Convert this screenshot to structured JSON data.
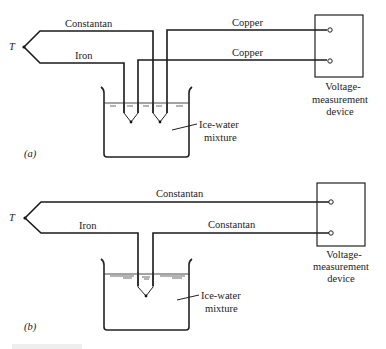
{
  "panels": [
    {
      "id": "a",
      "label": "(a)",
      "junction_label": "T",
      "wires": {
        "top_left": "Constantan",
        "bottom_left": "Iron",
        "top_right": "Copper",
        "bottom_right": "Copper"
      },
      "bath_label_line1": "Ice-water",
      "bath_label_line2": "mixture",
      "device_label_line1": "Voltage-",
      "device_label_line2": "measurement",
      "device_label_line3": "device"
    },
    {
      "id": "b",
      "label": "(b)",
      "junction_label": "T",
      "wires": {
        "top": "Constantan",
        "bottom_left": "Iron",
        "bottom_right": "Constantan"
      },
      "bath_label_line1": "Ice-water",
      "bath_label_line2": "mixture",
      "device_label_line1": "Voltage-",
      "device_label_line2": "measurement",
      "device_label_line3": "device"
    }
  ]
}
